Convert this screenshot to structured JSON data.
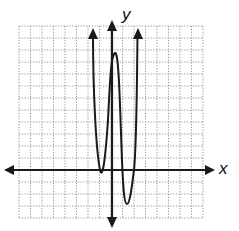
{
  "chart_data": {
    "type": "line",
    "title": "",
    "xlabel": "x",
    "ylabel": "y",
    "xlim": [
      -8,
      8
    ],
    "ylim": [
      -4,
      12
    ],
    "grid": true,
    "grid_style": "dotted",
    "tick_labels": false,
    "series": [
      {
        "name": "polynomial curve",
        "description": "Curve rising from top-left arrow, touching x-axis at x=-1 (double root), peaking near (0.25, 9.75), crossing x-axis near x=0.8, minimum near (1.3, -2.8), crossing x-axis near x=2, rising to top-right arrow.",
        "end_behavior": "both ends up (arrows)",
        "key_points": [
          {
            "x": -1.65,
            "y": 11.7,
            "note": "left arrow end"
          },
          {
            "x": -1.0,
            "y": 0,
            "note": "touches x-axis"
          },
          {
            "x": 0.25,
            "y": 9.75,
            "note": "local max"
          },
          {
            "x": 0.8,
            "y": 0,
            "note": "x-intercept"
          },
          {
            "x": 1.3,
            "y": -2.8,
            "note": "local min"
          },
          {
            "x": 2.0,
            "y": 0,
            "note": "x-intercept"
          },
          {
            "x": 2.2,
            "y": 11.7,
            "note": "right arrow end"
          }
        ]
      }
    ]
  },
  "labels": {
    "x_axis": "x",
    "y_axis": "y"
  },
  "colors": {
    "curve": "#1a1a1a",
    "axes": "#1a1a1a",
    "grid": "#8a8a8a",
    "background": "#ffffff"
  }
}
